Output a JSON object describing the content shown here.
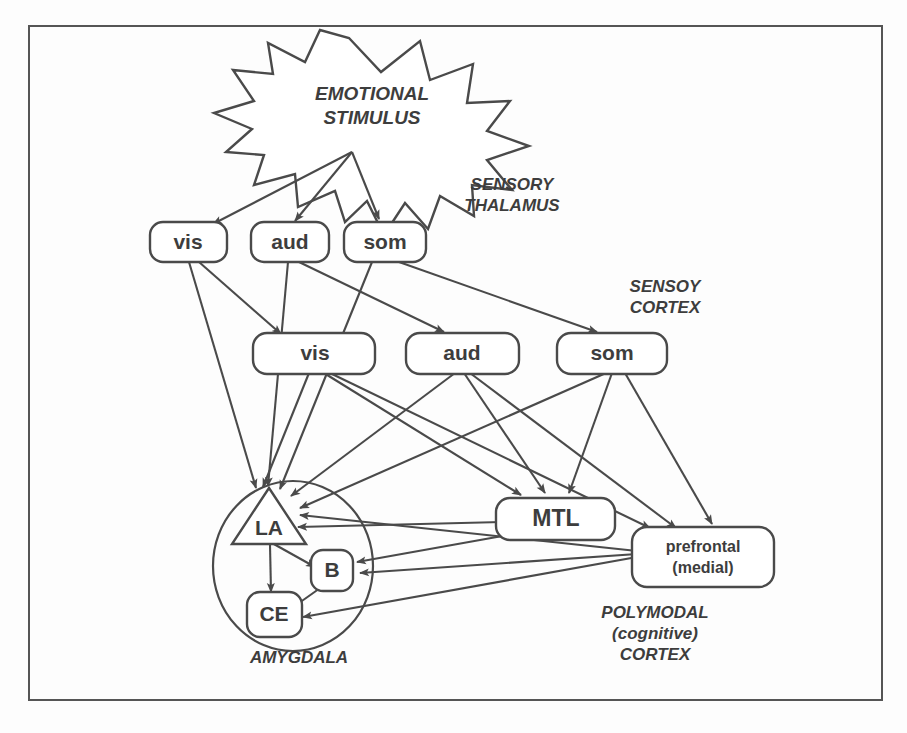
{
  "figure": {
    "frame": {
      "stroke_color": "#555555"
    },
    "line_color": "#4a4a4a",
    "background_color": "#fdfdfd"
  },
  "stimulus": {
    "line1": "EMOTIONAL",
    "line2": "STIMULUS",
    "shape": "starburst"
  },
  "region_labels": [
    {
      "id": "sensory-thalamus",
      "line1": "SENSORY",
      "line2": "THALAMUS",
      "x": 512,
      "y": 196
    },
    {
      "id": "sensory-cortex",
      "line1": "SENSOY",
      "line2": "CORTEX",
      "x": 665,
      "y": 297
    },
    {
      "id": "amygdala",
      "line1": "AMYGDALA",
      "line2": "",
      "x": 299,
      "y": 660
    },
    {
      "id": "polymodal-cortex",
      "line1": "POLYMODAL",
      "line2": "(cognitive)",
      "line3": "CORTEX",
      "x": 655,
      "y": 622
    }
  ],
  "thalamus_nodes": [
    {
      "id": "thal-vis",
      "label": "vis",
      "x": 188,
      "y": 242
    },
    {
      "id": "thal-aud",
      "label": "aud",
      "x": 290,
      "y": 242
    },
    {
      "id": "thal-som",
      "label": "som",
      "x": 385,
      "y": 242
    }
  ],
  "cortex_nodes": [
    {
      "id": "ctx-vis",
      "label": "vis",
      "x": 315,
      "y": 353
    },
    {
      "id": "ctx-aud",
      "label": "aud",
      "x": 461,
      "y": 353
    },
    {
      "id": "ctx-som",
      "label": "som",
      "x": 617,
      "y": 353
    }
  ],
  "amygdala_nodes": [
    {
      "id": "amy-la",
      "label": "LA",
      "shape": "triangle",
      "x": 268,
      "y": 525
    },
    {
      "id": "amy-b",
      "label": "B",
      "shape": "rounded-square",
      "x": 331,
      "y": 570
    },
    {
      "id": "amy-ce",
      "label": "CE",
      "shape": "rounded-square",
      "x": 274,
      "y": 614
    }
  ],
  "cognitive_nodes": [
    {
      "id": "node-mtl",
      "label": "MTL",
      "x": 554,
      "y": 519
    },
    {
      "id": "node-prefrontal",
      "line1": "prefrontal",
      "line2": "(medial)",
      "x": 701,
      "y": 557
    }
  ],
  "connections": {
    "stimulus_to_thalamus": [
      "vis",
      "aud",
      "som"
    ],
    "thalamus_to_cortex": [
      "vis->vis",
      "aud->aud",
      "som->som"
    ],
    "thalamus_to_amygdala": [
      "vis->LA",
      "aud->LA",
      "som->LA"
    ],
    "cortex_to_amygdala": [
      "vis->LA",
      "aud->LA",
      "som->LA"
    ],
    "cortex_to_mtl": [
      "vis->MTL",
      "aud->MTL",
      "som->MTL"
    ],
    "cortex_to_prefrontal": [
      "vis->prefrontal",
      "aud->prefrontal",
      "som->prefrontal"
    ],
    "mtl_to_amygdala": [
      "MTL->LA",
      "MTL->B"
    ],
    "prefrontal_to_amygdala": [
      "prefrontal->LA",
      "prefrontal->B",
      "prefrontal->CE"
    ],
    "intra_amygdala": [
      "LA->B",
      "LA->CE",
      "B->CE"
    ]
  }
}
